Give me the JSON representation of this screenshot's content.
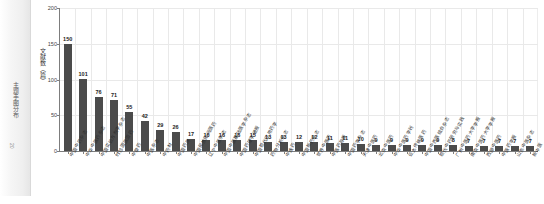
{
  "sidebar": {
    "tab_label": "主题手图分布",
    "count_label": "20"
  },
  "topbar": {
    "icons": [
      "circle-icon",
      "circle-icon",
      "marker-icon",
      "marker-icon",
      "marker-icon",
      "marker-icon",
      "marker-icon"
    ]
  },
  "chart_data": {
    "type": "bar",
    "title": "",
    "subtitle": "",
    "xlabel": "",
    "ylabel": "文献数（篇）",
    "ylim": [
      0,
      200
    ],
    "yticks": [
      0,
      50,
      100,
      150,
      200
    ],
    "grid": true,
    "legend": false,
    "bar_color": "#4b4b4b",
    "grid_color": "#e9e9e9",
    "axis_color": "#7d7d7d",
    "categories": [
      "中国中药杂志",
      "中华中医药杂志",
      "中国实验方剂学杂志",
      "时珍国医国药",
      "中草药",
      "中医杂志",
      "中药材",
      "中国药房",
      "中国民族民间医药",
      "辽宁中医杂志",
      "中国中医基础医学杂志",
      "中国药理学通报",
      "中国现代应用药学",
      "药物分析杂志",
      "中成药",
      "中国新药杂志",
      "世界中医药",
      "中医药导报",
      "中国药学杂志",
      "天津中医药",
      "北京中医药",
      "中华中医药学刊",
      "亚太传统医药",
      "中国中西医结合杂志",
      "现代中药研究与实践",
      "广州中医药大学学报",
      "南京中医药大学学报",
      "西部中医药",
      "中医药学报",
      "山东中医杂志",
      "新中医"
    ],
    "values": [
      150,
      101,
      76,
      71,
      55,
      42,
      29,
      26,
      17,
      16,
      16,
      16,
      15,
      13,
      13,
      12,
      12,
      11,
      11,
      10,
      9,
      9,
      9,
      9,
      9,
      8,
      7,
      7,
      7,
      7,
      7
    ]
  }
}
